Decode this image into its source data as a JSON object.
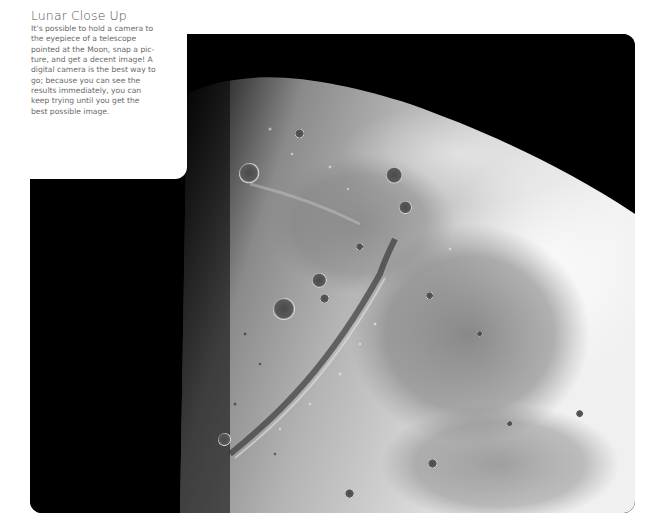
{
  "caption": {
    "title": "Lunar Close Up",
    "lines": [
      "It’s possible to hold a camera to",
      "the eyepiece of a telescope",
      "pointed at the Moon, snap a pic-",
      "ture, and get a decent image! A",
      "digital camera is the best way to",
      "go; because you can see the",
      "results immediately, you can",
      "keep trying until you get the",
      "best possible image."
    ]
  },
  "photo": {
    "subject": "Moon surface close-up",
    "colors": {
      "space": "#000000",
      "highland": "#e8e8e8",
      "mare": "#8f8f8f",
      "terminator": "#1a1a1a"
    }
  }
}
